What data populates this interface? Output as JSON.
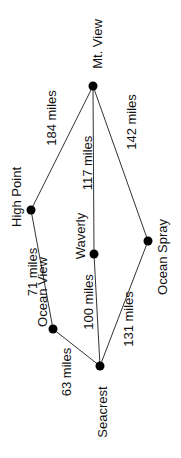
{
  "diagram": {
    "type": "weighted-graph",
    "unit": "miles",
    "colors": {
      "edge": "#333333",
      "node": "#000000",
      "text": "#111111",
      "background": "#ffffff"
    },
    "nodes": [
      {
        "id": "mt_view",
        "label": "Mt. View",
        "x": 93,
        "y": 86,
        "lx": 97,
        "ly": 44
      },
      {
        "id": "high_point",
        "label": "High Point",
        "x": 31,
        "y": 210,
        "lx": 16,
        "ly": 197
      },
      {
        "id": "waverly",
        "label": "Waverly",
        "x": 94,
        "y": 254,
        "lx": 80,
        "ly": 236
      },
      {
        "id": "ocean_spray",
        "label": "Ocean Spray",
        "x": 148,
        "y": 241,
        "lx": 162,
        "ly": 257
      },
      {
        "id": "ocean_view",
        "label": "Ocean View",
        "x": 53,
        "y": 329,
        "lx": 42,
        "ly": 292
      },
      {
        "id": "seacrest",
        "label": "Seacrest",
        "x": 100,
        "y": 366,
        "lx": 102,
        "ly": 412
      }
    ],
    "edges": [
      {
        "from": "mt_view",
        "to": "high_point",
        "x1": 93,
        "y1": 86,
        "x2": 31,
        "y2": 210,
        "label": "184 miles",
        "lx": 51,
        "ly": 118
      },
      {
        "from": "mt_view",
        "to": "waverly",
        "x1": 93,
        "y1": 86,
        "x2": 94,
        "y2": 254,
        "label": "117 miles",
        "lx": 87,
        "ly": 163
      },
      {
        "from": "mt_view",
        "to": "ocean_spray",
        "x1": 93,
        "y1": 86,
        "x2": 148,
        "y2": 241,
        "label": "142 miles",
        "lx": 131,
        "ly": 122
      },
      {
        "from": "high_point",
        "to": "ocean_view",
        "x1": 31,
        "y1": 210,
        "x2": 53,
        "y2": 329,
        "label": "71 miles",
        "lx": 32,
        "ly": 272
      },
      {
        "from": "waverly",
        "to": "seacrest",
        "x1": 94,
        "y1": 254,
        "x2": 100,
        "y2": 366,
        "label": "100 miles",
        "lx": 88,
        "ly": 302
      },
      {
        "from": "ocean_view",
        "to": "seacrest",
        "x1": 53,
        "y1": 329,
        "x2": 100,
        "y2": 366,
        "label": "63 miles",
        "lx": 66,
        "ly": 372
      },
      {
        "from": "ocean_spray",
        "to": "seacrest",
        "x1": 148,
        "y1": 241,
        "x2": 100,
        "y2": 366,
        "label": "131 miles",
        "lx": 128,
        "ly": 319
      }
    ]
  }
}
